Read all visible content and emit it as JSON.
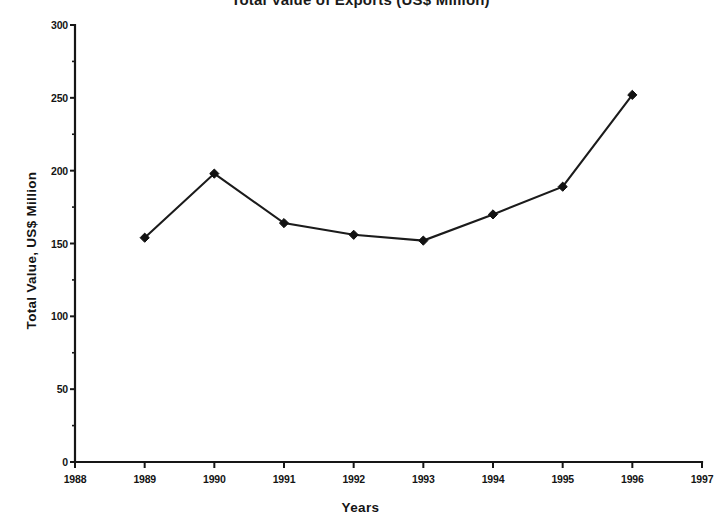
{
  "chart_data": {
    "type": "line",
    "title": "Total Value of Exports (US$ Million)",
    "xlabel": "Years",
    "ylabel": "Total Value, US$ Million",
    "x": [
      1989,
      1990,
      1991,
      1992,
      1993,
      1994,
      1995,
      1996
    ],
    "values": [
      154,
      198,
      164,
      156,
      152,
      170,
      189,
      252
    ],
    "categories": [
      "1989",
      "1990",
      "1991",
      "1992",
      "1993",
      "1994",
      "1995",
      "1996"
    ],
    "series": [
      {
        "name": "Total Value",
        "values": [
          154,
          198,
          164,
          156,
          152,
          170,
          189,
          252
        ]
      }
    ],
    "xlim": [
      1988,
      1997
    ],
    "ylim": [
      0,
      300
    ],
    "x_ticks": [
      "1988",
      "1989",
      "1990",
      "1991",
      "1992",
      "1993",
      "1994",
      "1995",
      "1996",
      "1997"
    ],
    "y_ticks": [
      "0",
      "50",
      "100",
      "150",
      "200",
      "250",
      "300"
    ],
    "y_minor_step": 25,
    "grid": false,
    "legend": false,
    "legend_position": "none",
    "marker": "diamond",
    "line_color": "#1b1b1b",
    "marker_color": "#121212",
    "axis_color": "#161616",
    "background_color": "#ffffff"
  },
  "axes": {
    "y_title": "Total Value, US$ Million",
    "x_title": "Years"
  }
}
